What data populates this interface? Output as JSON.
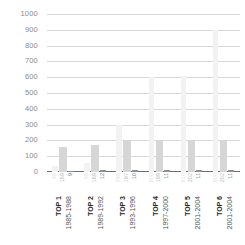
{
  "chart_data": {
    "type": "bar",
    "title": "",
    "subtitle": "",
    "xlabel": "",
    "ylabel": "",
    "ylim": [
      0,
      1000
    ],
    "ytick_step": 100,
    "grid": true,
    "legend": "none",
    "orientation": "vertical",
    "grouped": true,
    "categories": [
      "TOP 1",
      "TOP 2",
      "TOP 3",
      "TOP 4",
      "TOP 5",
      "TOP 6"
    ],
    "category_sublabels": [
      "1985-1988",
      "1989-1992",
      "1993-1996",
      "1997-2000",
      "2001-2004",
      "2001-2004"
    ],
    "yticks": [
      "1000",
      "900",
      "800",
      "700",
      "600",
      "500",
      "400",
      "300",
      "200",
      "100",
      "0"
    ],
    "ytick_values": [
      1000,
      900,
      800,
      700,
      600,
      500,
      400,
      300,
      200,
      100,
      0
    ],
    "series": [
      {
        "name": "series-1",
        "color": "#f2f2f2",
        "values": [
          36,
          55,
          295,
          600,
          610,
          900
        ]
      },
      {
        "name": "series-2",
        "color": "#d6d6d6",
        "values": [
          159,
          169,
          197,
          199,
          202,
          202
        ]
      },
      {
        "name": "series-3",
        "color": "#8f8f8f",
        "values": [
          9,
          12,
          10,
          11,
          11,
          11
        ]
      }
    ],
    "value_labels": [
      {
        "v1": "36",
        "v2": "159",
        "v3": "9"
      },
      {
        "v1": "55",
        "v2": "169",
        "v3": "12"
      },
      {
        "v1": "295",
        "v2": "197",
        "v3": "10"
      },
      {
        "v1": "600",
        "v2": "199",
        "v3": "11"
      },
      {
        "v1": "610",
        "v2": "202",
        "v3": "11"
      },
      {
        "v1": "900",
        "v2": "202",
        "v3": "11"
      }
    ],
    "colors": {
      "series_1": "#f2f2f2",
      "series_2": "#d6d6d6",
      "series_3": "#8f8f8f",
      "gridline": "#d8d8d8",
      "axis": "#6e6e6e",
      "tick_text": "#8a8a8a",
      "category_text": "#2b2b2b",
      "range_text": "#555555"
    }
  }
}
